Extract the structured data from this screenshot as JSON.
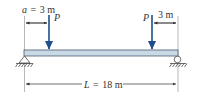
{
  "diagram": {
    "type": "simply-supported beam with two point loads",
    "colors": {
      "beam_fill": "#c9d9e6",
      "beam_stroke": "#4a5a6a",
      "load_arrow": "#1f4e8c",
      "dimension_line": "#333333",
      "support": "#333333"
    },
    "loads": [
      {
        "label": "P",
        "position_label": "a = 3 m",
        "from": "left support"
      },
      {
        "label": "P",
        "position_label": "3 m",
        "from": "right support"
      }
    ],
    "dimensions": {
      "left_offset": {
        "var": "a",
        "eq": "=",
        "value": "3 m"
      },
      "right_offset": {
        "value": "3 m"
      },
      "span": {
        "var": "L",
        "eq": "=",
        "value": "18 m"
      }
    },
    "supports": {
      "left": "pin",
      "right": "roller"
    }
  }
}
